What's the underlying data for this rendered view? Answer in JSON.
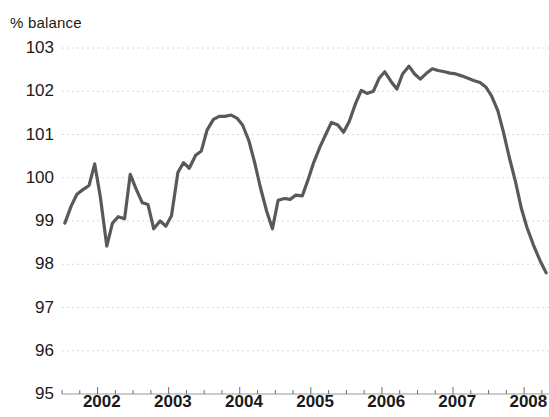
{
  "chart_data": {
    "type": "line",
    "title": "",
    "ylabel": "% balance",
    "xlabel": "",
    "ylim": [
      95,
      103
    ],
    "xlim": [
      2001.5,
      2008.35
    ],
    "grid": true,
    "legend": null,
    "line_color": "#595959",
    "grid_color": "#d8d8d8",
    "axis_color": "#1a1a1a",
    "ytick_labels": [
      "103",
      "102",
      "101",
      "100",
      "99",
      "98",
      "97",
      "96",
      "95"
    ],
    "ytick_values": [
      103,
      102,
      101,
      100,
      99,
      98,
      97,
      96,
      95
    ],
    "xtick_labels": [
      "2002",
      "2003",
      "2004",
      "2005",
      "2006",
      "2007",
      "2008"
    ],
    "xtick_values": [
      2002,
      2003,
      2004,
      2005,
      2006,
      2007,
      2008
    ],
    "x_minor_interval": 0.25,
    "x": [
      2001.54,
      2001.63,
      2001.71,
      2001.79,
      2001.88,
      2001.96,
      2002.04,
      2002.13,
      2002.21,
      2002.29,
      2002.38,
      2002.46,
      2002.54,
      2002.63,
      2002.71,
      2002.79,
      2002.88,
      2002.96,
      2003.04,
      2003.13,
      2003.21,
      2003.29,
      2003.38,
      2003.46,
      2003.54,
      2003.63,
      2003.71,
      2003.79,
      2003.88,
      2003.96,
      2004.04,
      2004.13,
      2004.21,
      2004.29,
      2004.38,
      2004.46,
      2004.54,
      2004.63,
      2004.71,
      2004.79,
      2004.88,
      2004.96,
      2005.04,
      2005.13,
      2005.21,
      2005.29,
      2005.38,
      2005.46,
      2005.54,
      2005.63,
      2005.71,
      2005.79,
      2005.88,
      2005.96,
      2006.04,
      2006.13,
      2006.21,
      2006.29,
      2006.38,
      2006.46,
      2006.54,
      2006.63,
      2006.71,
      2006.79,
      2006.88,
      2006.96,
      2007.04,
      2007.13,
      2007.21,
      2007.29,
      2007.38,
      2007.46,
      2007.54,
      2007.63,
      2007.71,
      2007.79,
      2007.88,
      2007.96,
      2008.04,
      2008.13,
      2008.22,
      2008.31
    ],
    "values": [
      98.95,
      99.35,
      99.62,
      99.72,
      99.82,
      100.32,
      99.55,
      98.42,
      98.95,
      99.1,
      99.05,
      100.08,
      99.75,
      99.42,
      99.38,
      98.82,
      99.0,
      98.88,
      99.12,
      100.12,
      100.35,
      100.22,
      100.52,
      100.62,
      101.1,
      101.35,
      101.42,
      101.42,
      101.45,
      101.38,
      101.22,
      100.85,
      100.35,
      99.78,
      99.22,
      98.82,
      99.48,
      99.52,
      99.5,
      99.6,
      99.58,
      99.95,
      100.35,
      100.72,
      101.0,
      101.28,
      101.22,
      101.05,
      101.3,
      101.72,
      102.02,
      101.95,
      102.0,
      102.3,
      102.45,
      102.22,
      102.05,
      102.4,
      102.58,
      102.4,
      102.28,
      102.42,
      102.52,
      102.48,
      102.45,
      102.42,
      102.4,
      102.35,
      102.3,
      102.25,
      102.2,
      102.1,
      101.9,
      101.55,
      101.05,
      100.48,
      99.9,
      99.3,
      98.85,
      98.45,
      98.1,
      97.8
    ]
  }
}
